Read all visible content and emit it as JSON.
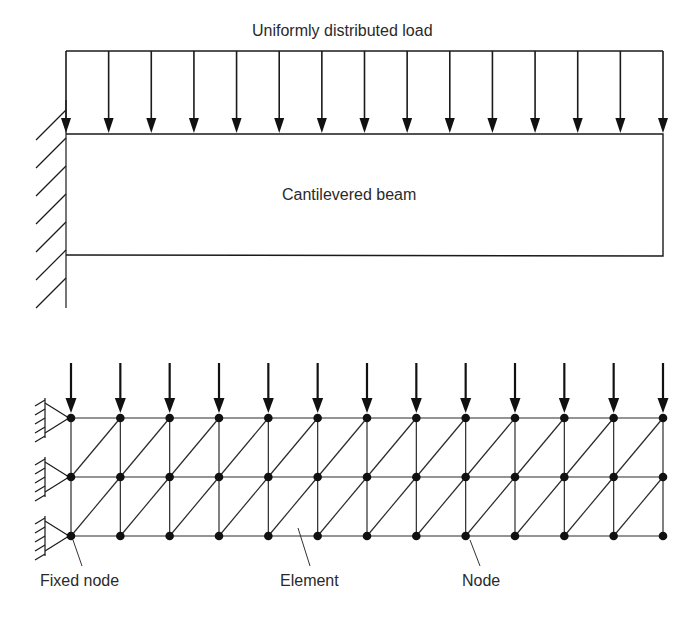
{
  "top_diagram": {
    "load_label": "Uniformly distributed load",
    "beam_label": "Cantilevered beam",
    "arrow_count": 15,
    "support": "fixed-wall"
  },
  "bottom_diagram": {
    "columns": 13,
    "rows": 3,
    "load_arrow_count": 13,
    "element_type": "triangular",
    "labels": {
      "fixed_node": "Fixed node",
      "element": "Element",
      "node": "Node"
    }
  },
  "colors": {
    "line": "#1a1a1a",
    "background": "#ffffff"
  }
}
